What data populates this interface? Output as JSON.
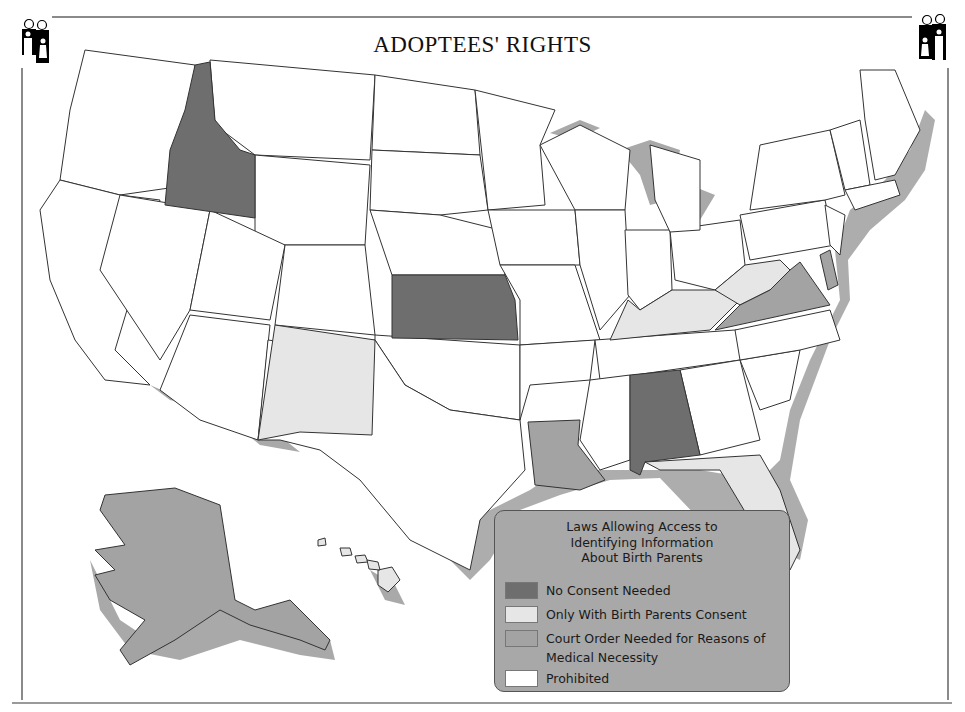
{
  "title": "ADOPTEES' RIGHTS",
  "icons": {
    "left": "family-icon",
    "right": "family-icon"
  },
  "colors": {
    "no_consent": "#6e6e6e",
    "birth_parent_consent": "#e6e6e6",
    "court_order": "#a3a3a3",
    "prohibited": "#ffffff",
    "water_shadow": "#a9a9a9",
    "border": "#333333",
    "legend_bg": "#a8a8a8"
  },
  "legend": {
    "title_line1": "Laws Allowing Access to",
    "title_line2": "Identifying Information",
    "title_line3": "About Birth Parents",
    "items": [
      {
        "label": "No Consent Needed",
        "category": "no_consent"
      },
      {
        "label": "Only With Birth Parents Consent",
        "category": "birth_parent_consent"
      },
      {
        "label": "Court Order Needed for Reasons of\nMedical  Necessity",
        "category": "court_order"
      },
      {
        "label": "Prohibited",
        "category": "prohibited"
      }
    ]
  },
  "states": {
    "no_consent": [
      "Idaho",
      "Kansas",
      "Alabama"
    ],
    "birth_parent_consent": [
      "New Mexico",
      "Kentucky",
      "West Virginia",
      "Florida",
      "Hawaii"
    ],
    "court_order": [
      "Virginia",
      "Louisiana",
      "Alaska",
      "Delaware"
    ],
    "prohibited": [
      "all other states"
    ]
  }
}
